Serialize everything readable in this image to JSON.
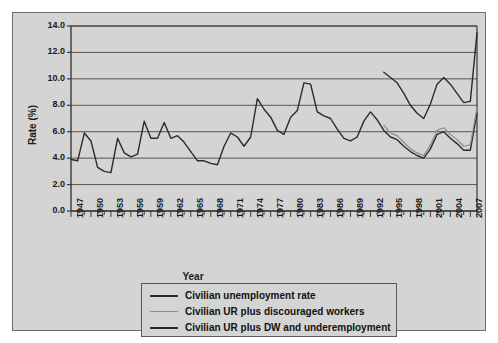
{
  "chart_data": {
    "type": "line",
    "title": "",
    "xlabel": "Year",
    "ylabel": "Rate (%)",
    "ylim": [
      0.0,
      14.0
    ],
    "xlim": [
      1947,
      2008
    ],
    "ytick_step": 2.0,
    "yticks": [
      "0.0",
      "2.0",
      "4.0",
      "6.0",
      "8.0",
      "10.0",
      "12.0",
      "14.0"
    ],
    "xticks": [
      "1947",
      "1950",
      "1953",
      "1956",
      "1959",
      "1962",
      "1965",
      "1968",
      "1971",
      "1974",
      "1977",
      "1980",
      "1983",
      "1986",
      "1989",
      "1992",
      "1995",
      "1998",
      "2001",
      "2004",
      "2007"
    ],
    "xtick_step": 3,
    "grid": "horizontal",
    "legend_position": "below-plot",
    "colors": {
      "series1": "#2b2b2b",
      "series2": "#8c8c8c",
      "series3": "#2b2b2b",
      "panel_background": "#d4d4d4",
      "gridline": "#555555",
      "axis": "#3a3a3a"
    },
    "series": [
      {
        "name": "Civilian unemployment rate",
        "color": "#2b2b2b",
        "x": [
          1947,
          1948,
          1949,
          1950,
          1951,
          1952,
          1953,
          1954,
          1955,
          1956,
          1957,
          1958,
          1959,
          1960,
          1961,
          1962,
          1963,
          1964,
          1965,
          1966,
          1967,
          1968,
          1969,
          1970,
          1971,
          1972,
          1973,
          1974,
          1975,
          1976,
          1977,
          1978,
          1979,
          1980,
          1981,
          1982,
          1983,
          1984,
          1985,
          1986,
          1987,
          1988,
          1989,
          1990,
          1991,
          1992,
          1993,
          1994,
          1995,
          1996,
          1997,
          1998,
          1999,
          2000,
          2001,
          2002,
          2003,
          2004,
          2005,
          2006,
          2007,
          2008
        ],
        "values": [
          3.9,
          3.8,
          5.9,
          5.3,
          3.3,
          3.0,
          2.9,
          5.5,
          4.4,
          4.1,
          4.3,
          6.8,
          5.5,
          5.5,
          6.7,
          5.5,
          5.7,
          5.2,
          4.5,
          3.8,
          3.8,
          3.6,
          3.5,
          4.9,
          5.9,
          5.6,
          4.9,
          5.6,
          8.5,
          7.7,
          7.1,
          6.1,
          5.8,
          7.1,
          7.6,
          9.7,
          9.6,
          7.5,
          7.2,
          7.0,
          6.2,
          5.5,
          5.3,
          5.6,
          6.8,
          7.5,
          6.9,
          6.1,
          5.6,
          5.4,
          4.9,
          4.5,
          4.2,
          4.0,
          4.7,
          5.8,
          6.0,
          5.5,
          5.1,
          4.6,
          4.6,
          7.4
        ]
      },
      {
        "name": "Civilian UR plus discouraged workers",
        "color": "#8c8c8c",
        "x": [
          1994,
          1995,
          1996,
          1997,
          1998,
          1999,
          2000,
          2001,
          2002,
          2003,
          2004,
          2005,
          2006,
          2007,
          2008
        ],
        "values": [
          6.5,
          5.9,
          5.7,
          5.2,
          4.7,
          4.4,
          4.2,
          5.0,
          6.1,
          6.3,
          5.8,
          5.4,
          4.9,
          5.0,
          7.8
        ]
      },
      {
        "name": "Civilian UR plus DW and underemployment",
        "color": "#2b2b2b",
        "x": [
          1994,
          1995,
          1996,
          1997,
          1998,
          1999,
          2000,
          2001,
          2002,
          2003,
          2004,
          2005,
          2006,
          2007,
          2008
        ],
        "values": [
          10.5,
          10.1,
          9.7,
          8.9,
          8.0,
          7.4,
          7.0,
          8.1,
          9.6,
          10.1,
          9.6,
          8.9,
          8.2,
          8.3,
          13.5
        ]
      }
    ]
  },
  "legend": {
    "items": [
      {
        "label": "Civilian unemployment rate",
        "color": "#2b2b2b"
      },
      {
        "label": "Civilian UR plus discouraged workers",
        "color": "#8c8c8c"
      },
      {
        "label": "Civilian UR plus DW and underemployment",
        "color": "#2b2b2b"
      }
    ]
  },
  "axes": {
    "y_title": "Rate (%)",
    "x_title": "Year"
  }
}
